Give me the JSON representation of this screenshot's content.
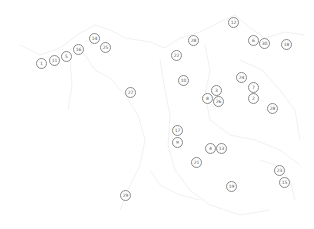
{
  "map": {
    "outline_color": "#ececec",
    "marker_border_color": "#8a8a8a",
    "marker_text_color": "#555555",
    "markers": [
      {
        "label": "1",
        "x": 41,
        "y": 63
      },
      {
        "label": "11",
        "x": 54,
        "y": 60
      },
      {
        "label": "5",
        "x": 66,
        "y": 56
      },
      {
        "label": "16",
        "x": 78,
        "y": 49
      },
      {
        "label": "14",
        "x": 94,
        "y": 38
      },
      {
        "label": "25",
        "x": 105,
        "y": 47
      },
      {
        "label": "27",
        "x": 130,
        "y": 92
      },
      {
        "label": "12",
        "x": 233,
        "y": 22
      },
      {
        "label": "28",
        "x": 193,
        "y": 40
      },
      {
        "label": "22",
        "x": 176,
        "y": 55
      },
      {
        "label": "6",
        "x": 253,
        "y": 40
      },
      {
        "label": "30",
        "x": 264,
        "y": 43
      },
      {
        "label": "18",
        "x": 286,
        "y": 44
      },
      {
        "label": "10",
        "x": 183,
        "y": 80
      },
      {
        "label": "3",
        "x": 216,
        "y": 90
      },
      {
        "label": "8",
        "x": 207,
        "y": 98
      },
      {
        "label": "26",
        "x": 218,
        "y": 101
      },
      {
        "label": "24",
        "x": 241,
        "y": 77
      },
      {
        "label": "7",
        "x": 253,
        "y": 87
      },
      {
        "label": "2",
        "x": 253,
        "y": 98
      },
      {
        "label": "28",
        "x": 272,
        "y": 108
      },
      {
        "label": "17",
        "x": 177,
        "y": 130
      },
      {
        "label": "9",
        "x": 177,
        "y": 142
      },
      {
        "label": "4",
        "x": 210,
        "y": 148
      },
      {
        "label": "13",
        "x": 221,
        "y": 148
      },
      {
        "label": "21",
        "x": 196,
        "y": 162
      },
      {
        "label": "23",
        "x": 279,
        "y": 170
      },
      {
        "label": "15",
        "x": 284,
        "y": 182
      },
      {
        "label": "19",
        "x": 231,
        "y": 186
      },
      {
        "label": "29",
        "x": 125,
        "y": 195
      }
    ]
  }
}
